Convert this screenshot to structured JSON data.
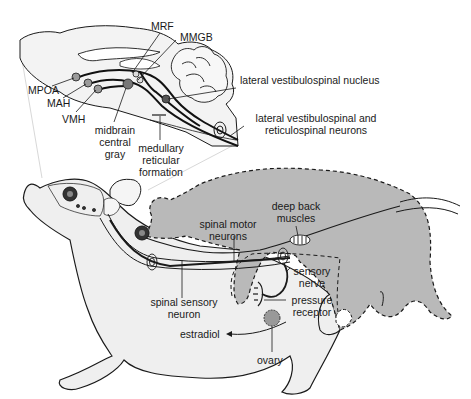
{
  "diagram": {
    "colors": {
      "background": "#ffffff",
      "outline": "#1a1a1a",
      "body_fill": "#efefef",
      "male_fill": "#b9b9b9",
      "brain_fill": "#f2f2f2",
      "nucleus_fill": "#8a8a8a"
    },
    "brain_labels": {
      "mrf": "MRF",
      "mmgb": "MMGB",
      "mpoa": "MPOA",
      "mah": "MAH",
      "vmh": "VMH",
      "midbrain_line1": "midbrain",
      "midbrain_line2": "central",
      "midbrain_line3": "gray",
      "medullary_line1": "medullary",
      "medullary_line2": "reticular",
      "medullary_line3": "formation",
      "lvn": "lateral vestibulospinal nucleus",
      "lvrn_line1": "lateral vestibulospinal and",
      "lvrn_line2": "reticulospinal neurons"
    },
    "body_labels": {
      "deep_back_line1": "deep back",
      "deep_back_line2": "muscles",
      "spinal_motor_line1": "spinal motor",
      "spinal_motor_line2": "neurons",
      "sensory_nerve_line1": "sensory",
      "sensory_nerve_line2": "nerve",
      "pressure_line1": "pressure",
      "pressure_line2": "receptor",
      "spinal_sensory_line1": "spinal sensory",
      "spinal_sensory_line2": "neuron",
      "estradiol": "estradiol",
      "ovary": "ovary"
    },
    "icons": [
      "eye-icon",
      "neuron-cell-icon",
      "ovary-icon",
      "pressure-receptor-icon",
      "muscle-icon",
      "arrow-left-icon"
    ]
  }
}
